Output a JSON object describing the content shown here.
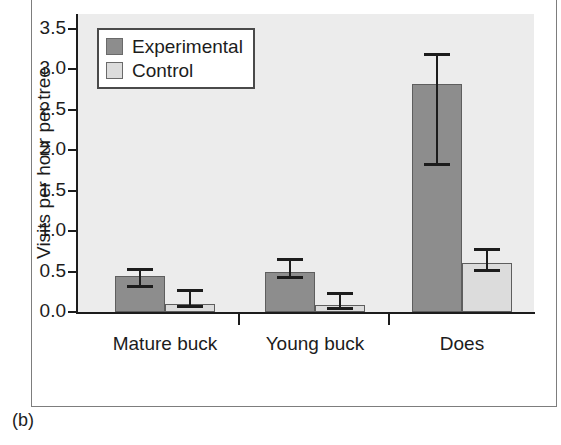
{
  "caption": "(b)",
  "chart_data": {
    "type": "bar",
    "title": "",
    "xlabel": "",
    "ylabel": "Visits per hour per tree",
    "ylim": [
      0.0,
      3.5
    ],
    "yticks": [
      "0.0",
      "0.5",
      "1.0",
      "1.5",
      "2.0",
      "2.5",
      "3.0",
      "3.5"
    ],
    "ytick_values": [
      0.0,
      0.5,
      1.0,
      1.5,
      2.0,
      2.5,
      3.0,
      3.5
    ],
    "grid": false,
    "legend_position": "top-left",
    "categories": [
      "Mature buck",
      "Young buck",
      "Does"
    ],
    "series": [
      {
        "name": "Experimental",
        "color": "#8d8d8d",
        "values": [
          0.44,
          0.5,
          2.82
        ],
        "error_low": [
          0.3,
          0.41,
          1.8
        ],
        "error_high": [
          0.54,
          0.67,
          3.2
        ]
      },
      {
        "name": "Control",
        "color": "#dcdcdc",
        "values": [
          0.1,
          0.09,
          0.61
        ],
        "error_low": [
          0.05,
          0.02,
          0.5
        ],
        "error_high": [
          0.28,
          0.25,
          0.79
        ]
      }
    ]
  }
}
